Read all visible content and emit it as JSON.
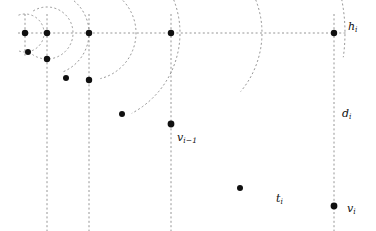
{
  "figure": {
    "background": "#ffffff",
    "stroke_color": "#8a8a8a",
    "point_color": "#101010",
    "label_color": "#101010",
    "width": 376,
    "height": 231
  },
  "labels": {
    "h_i": {
      "base": "h",
      "sub": "i",
      "x": 348,
      "y": 20
    },
    "d_i": {
      "base": "d",
      "sub": "i",
      "x": 342,
      "y": 107
    },
    "v_prev": {
      "base": "v",
      "sub": "i−1",
      "x": 177,
      "y": 131
    },
    "t_i": {
      "base": "t",
      "sub": "i",
      "x": 276,
      "y": 192
    },
    "v_i": {
      "base": "v",
      "sub": "i",
      "x": 347,
      "y": 202
    }
  },
  "chart_data": {
    "type": "diagram",
    "title": "",
    "xlabel": "",
    "ylabel": "",
    "xlim": [
      0,
      376
    ],
    "ylim": [
      0,
      231
    ],
    "grid": false,
    "legend": "none",
    "horizontal_line": {
      "y": 33,
      "x_start": 18,
      "x_end": 347
    },
    "vertical_lines": [
      {
        "x": 25,
        "y_start": 14,
        "y_end": 56
      },
      {
        "x": 47,
        "y_start": 14,
        "y_end": 231
      },
      {
        "x": 89,
        "y_start": 14,
        "y_end": 231
      },
      {
        "x": 171,
        "y_start": 14,
        "y_end": 231
      },
      {
        "x": 334,
        "y_start": 14,
        "y_end": 231
      }
    ],
    "points": [
      {
        "name": "p-h-a",
        "x": 25,
        "y": 33,
        "r": 3.2
      },
      {
        "name": "p-h-b",
        "x": 47,
        "y": 33,
        "r": 3.2
      },
      {
        "name": "p-h-c",
        "x": 89,
        "y": 33,
        "r": 3.2
      },
      {
        "name": "p-h-d",
        "x": 171,
        "y": 33,
        "r": 3.2
      },
      {
        "name": "p-h-e",
        "x": 334,
        "y": 33,
        "r": 3.2
      },
      {
        "name": "p-low-a",
        "x": 28,
        "y": 52,
        "r": 3.0
      },
      {
        "name": "p-low-b",
        "x": 47,
        "y": 59,
        "r": 3.2
      },
      {
        "name": "p-low-c",
        "x": 66,
        "y": 78,
        "r": 3.0
      },
      {
        "name": "p-low-d",
        "x": 89,
        "y": 80,
        "r": 3.2
      },
      {
        "name": "p-low-e",
        "x": 122,
        "y": 114,
        "r": 3.0
      },
      {
        "name": "p-v-prev",
        "x": 171,
        "y": 124,
        "r": 3.4
      },
      {
        "name": "p-t-i",
        "x": 240,
        "y": 188,
        "r": 3.0
      },
      {
        "name": "p-v-i",
        "x": 334,
        "y": 206,
        "r": 3.4
      }
    ],
    "arcs": [
      {
        "name": "arc-1",
        "cx": 25,
        "cy": 33,
        "r": 19,
        "start_deg": 250,
        "end_deg": 110
      },
      {
        "name": "arc-2",
        "cx": 47,
        "cy": 33,
        "r": 26,
        "start_deg": 238,
        "end_deg": 125
      },
      {
        "name": "arc-3",
        "cx": 47,
        "cy": 33,
        "r": 42,
        "start_deg": 262,
        "end_deg": 70
      },
      {
        "name": "arc-4",
        "cx": 89,
        "cy": 33,
        "r": 47,
        "start_deg": 268,
        "end_deg": 77
      },
      {
        "name": "arc-5",
        "cx": 89,
        "cy": 33,
        "r": 91,
        "start_deg": 272,
        "end_deg": 62
      },
      {
        "name": "arc-6",
        "cx": 171,
        "cy": 33,
        "r": 91,
        "start_deg": 272,
        "end_deg": 40
      },
      {
        "name": "arc-7",
        "cx": 171,
        "cy": 33,
        "r": 174,
        "start_deg": 272,
        "end_deg": 8
      }
    ]
  }
}
